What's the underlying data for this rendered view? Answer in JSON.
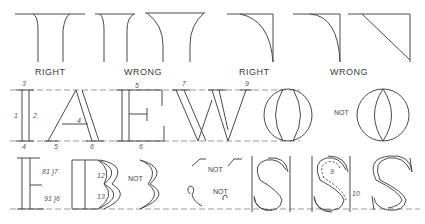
{
  "figure": {
    "top_row": {
      "serif_examples": [
        {
          "id": "serif-right",
          "label": "RIGHT"
        },
        {
          "id": "serif-wrong",
          "label": "WRONG"
        },
        {
          "id": "corner-right",
          "label": "RIGHT"
        },
        {
          "id": "corner-wrong",
          "label": "WRONG"
        }
      ]
    },
    "middle_row": {
      "letters": [
        "I",
        "A",
        "E",
        "W",
        "O",
        "O"
      ],
      "not_label": "NOT",
      "I_strokes": [
        "1",
        "2",
        "3",
        "4"
      ],
      "A_strokes": [
        "1",
        "2",
        "3",
        "4",
        "5",
        "6"
      ],
      "E_strokes": [
        "1",
        "2",
        "3",
        "4",
        "5",
        "6",
        "7",
        "8"
      ],
      "W_strokes": [
        "1",
        "2",
        "3",
        "4",
        "5",
        "6",
        "7",
        "8",
        "9"
      ],
      "O_strokes": [
        "1",
        "2",
        "3",
        "4"
      ]
    },
    "bottom_row": {
      "letters": [
        "E",
        "B",
        "B",
        "S",
        "S",
        "S"
      ],
      "not_labels": [
        "NOT",
        "NOT",
        "NOT"
      ],
      "E_strokes": [
        "1",
        "2",
        "3",
        "4",
        "5",
        "81 }7",
        "91 }6"
      ],
      "B_strokes": [
        "12",
        "13",
        "10",
        "11"
      ],
      "S_strokes": [
        "1",
        "2",
        "3",
        "4",
        "5",
        "6",
        "7",
        "8"
      ],
      "S2_strokes": [
        "9",
        "11",
        "12",
        "10"
      ]
    }
  }
}
